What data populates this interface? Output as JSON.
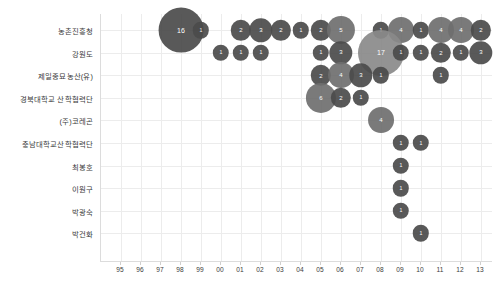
{
  "chart_data": {
    "type": "scatter",
    "title": "",
    "xlabel": "",
    "ylabel": "",
    "grid": true,
    "legend": "none",
    "x_tick_labels": [
      "95",
      "96",
      "97",
      "98",
      "99",
      "00",
      "01",
      "02",
      "03",
      "04",
      "05",
      "06",
      "07",
      "08",
      "09",
      "10",
      "11",
      "12",
      "13"
    ],
    "categories": [
      "농촌진흥청",
      "강원도",
      "제일종묘농산(유)",
      "경북대학교 산학협력단",
      "(주)코레곤",
      "충남대학교산학협력단",
      "최봉호",
      "이원구",
      "박광숙",
      "박건화"
    ],
    "points": [
      {
        "category": "농촌진흥청",
        "year": "98",
        "value": 16
      },
      {
        "category": "농촌진흥청",
        "year": "99",
        "value": 1
      },
      {
        "category": "농촌진흥청",
        "year": "01",
        "value": 2
      },
      {
        "category": "농촌진흥청",
        "year": "02",
        "value": 3
      },
      {
        "category": "농촌진흥청",
        "year": "03",
        "value": 2
      },
      {
        "category": "농촌진흥청",
        "year": "04",
        "value": 1
      },
      {
        "category": "농촌진흥청",
        "year": "05",
        "value": 2
      },
      {
        "category": "농촌진흥청",
        "year": "06",
        "value": 5
      },
      {
        "category": "농촌진흥청",
        "year": "08",
        "value": 1
      },
      {
        "category": "농촌진흥청",
        "year": "09",
        "value": 4
      },
      {
        "category": "농촌진흥청",
        "year": "10",
        "value": 1
      },
      {
        "category": "농촌진흥청",
        "year": "11",
        "value": 4
      },
      {
        "category": "농촌진흥청",
        "year": "12",
        "value": 4
      },
      {
        "category": "농촌진흥청",
        "year": "13",
        "value": 2
      },
      {
        "category": "강원도",
        "year": "00",
        "value": 1
      },
      {
        "category": "강원도",
        "year": "01",
        "value": 1
      },
      {
        "category": "강원도",
        "year": "02",
        "value": 1
      },
      {
        "category": "강원도",
        "year": "05",
        "value": 1
      },
      {
        "category": "강원도",
        "year": "06",
        "value": 3
      },
      {
        "category": "강원도",
        "year": "08",
        "value": 17
      },
      {
        "category": "강원도",
        "year": "09",
        "value": 1
      },
      {
        "category": "강원도",
        "year": "10",
        "value": 1
      },
      {
        "category": "강원도",
        "year": "11",
        "value": 2
      },
      {
        "category": "강원도",
        "year": "12",
        "value": 1
      },
      {
        "category": "강원도",
        "year": "13",
        "value": 3
      },
      {
        "category": "제일종묘농산(유)",
        "year": "05",
        "value": 2
      },
      {
        "category": "제일종묘농산(유)",
        "year": "06",
        "value": 4
      },
      {
        "category": "제일종묘농산(유)",
        "year": "07",
        "value": 3
      },
      {
        "category": "제일종묘농산(유)",
        "year": "08",
        "value": 1
      },
      {
        "category": "제일종묘농산(유)",
        "year": "11",
        "value": 1
      },
      {
        "category": "경북대학교 산학협력단",
        "year": "05",
        "value": 6
      },
      {
        "category": "경북대학교 산학협력단",
        "year": "06",
        "value": 2
      },
      {
        "category": "경북대학교 산학협력단",
        "year": "07",
        "value": 1
      },
      {
        "category": "(주)코레곤",
        "year": "08",
        "value": 4
      },
      {
        "category": "충남대학교산학협력단",
        "year": "09",
        "value": 1
      },
      {
        "category": "충남대학교산학협력단",
        "year": "10",
        "value": 1
      },
      {
        "category": "최봉호",
        "year": "09",
        "value": 1
      },
      {
        "category": "이원구",
        "year": "09",
        "value": 1
      },
      {
        "category": "박광숙",
        "year": "09",
        "value": 1
      },
      {
        "category": "박건화",
        "year": "10",
        "value": 1
      }
    ],
    "colors": {
      "bubble": "#4b4b4b",
      "bubble_light": "#8a8a8a",
      "grid": "#ececec",
      "axis": "#dcdcdc",
      "text": "#3b3b3b"
    }
  }
}
